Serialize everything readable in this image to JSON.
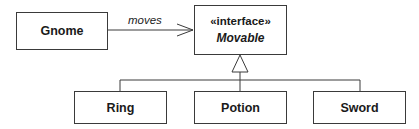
{
  "diagram": {
    "type": "UML class diagram",
    "classes": [
      {
        "id": "gnome",
        "name": "Gnome"
      },
      {
        "id": "ring",
        "name": "Ring"
      },
      {
        "id": "potion",
        "name": "Potion"
      },
      {
        "id": "sword",
        "name": "Sword"
      }
    ],
    "interface": {
      "id": "movable",
      "stereotype": "«interface»",
      "name": "Movable"
    },
    "relationships": [
      {
        "type": "association",
        "from": "Gnome",
        "to": "Movable",
        "label": "moves",
        "arrow": "open"
      },
      {
        "type": "realization",
        "from": "Ring",
        "to": "Movable"
      },
      {
        "type": "realization",
        "from": "Potion",
        "to": "Movable"
      },
      {
        "type": "realization",
        "from": "Sword",
        "to": "Movable"
      }
    ]
  },
  "colors": {
    "line": "#3a3a3a",
    "background": "#ffffff",
    "text": "#1a1a1a"
  }
}
